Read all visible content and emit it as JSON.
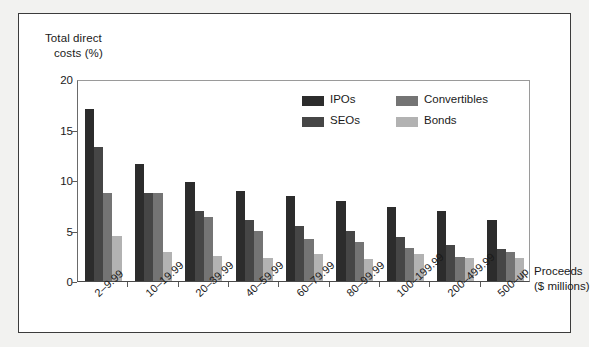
{
  "chart_data": {
    "type": "bar",
    "title": "",
    "ylabel": "Total direct costs (%)",
    "ylabel_line1": "Total direct",
    "ylabel_line2": "costs (%)",
    "xlabel": "Proceeds ($ millions)",
    "xlabel_line1": "Proceeds",
    "xlabel_line2": "($ millions)",
    "ylim": [
      0,
      20
    ],
    "yticks": [
      0,
      5,
      10,
      15,
      20
    ],
    "ytick_labels": [
      "0",
      "5",
      "10",
      "15",
      "20"
    ],
    "grid": false,
    "legend_position": "upper-center",
    "categories": [
      "2–9.99",
      "10–19.99",
      "20–39.99",
      "40–59.99",
      "60–79.99",
      "80–99.99",
      "100–199.99",
      "200–499.99",
      "500–up"
    ],
    "series": [
      {
        "name": "IPOs",
        "color": "#2c2c2c",
        "values": [
          17.0,
          11.6,
          9.8,
          8.9,
          8.4,
          7.9,
          7.3,
          6.9,
          6.0
        ]
      },
      {
        "name": "SEOs",
        "color": "#464646",
        "values": [
          13.3,
          8.7,
          6.9,
          6.0,
          5.4,
          5.0,
          4.4,
          3.6,
          3.2
        ]
      },
      {
        "name": "Convertibles",
        "color": "#747474",
        "values": [
          8.7,
          8.7,
          6.3,
          5.0,
          4.2,
          3.9,
          3.3,
          2.4,
          2.9
        ]
      },
      {
        "name": "Bonds",
        "color": "#b2b2b2",
        "values": [
          4.5,
          2.9,
          2.5,
          2.3,
          2.7,
          2.2,
          2.7,
          2.3,
          2.3
        ]
      }
    ]
  },
  "legend": {
    "items": [
      {
        "label": "IPOs",
        "swatch": "ipos"
      },
      {
        "label": "SEOs",
        "swatch": "seos"
      },
      {
        "label": "Convertibles",
        "swatch": "conv"
      },
      {
        "label": "Bonds",
        "swatch": "bond"
      }
    ]
  }
}
